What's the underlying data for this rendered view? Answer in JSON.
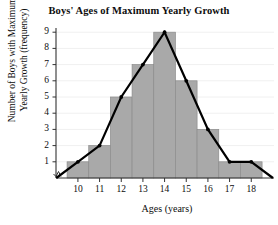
{
  "chart_data": {
    "type": "bar",
    "title": "Boys' Ages of Maximum Yearly Growth",
    "xlabel": "Ages (years)",
    "ylabel": "Number of Boys with Maximum Yearly Growth (frequency)",
    "ylabel_line1": "Number of Boys with Maximum",
    "ylabel_line2": "Yearly Growth (frequency)",
    "categories": [
      10,
      11,
      12,
      13,
      14,
      15,
      16,
      17,
      18
    ],
    "values": [
      1,
      2,
      5,
      7,
      9,
      6,
      3,
      1,
      1
    ],
    "x_tick_labels": [
      "10",
      "11",
      "12",
      "13",
      "14",
      "15",
      "16",
      "17",
      "18"
    ],
    "y_tick_labels": [
      "1",
      "2",
      "3",
      "4",
      "5",
      "6",
      "7",
      "8",
      "9"
    ],
    "ylim": [
      0,
      9
    ],
    "xlim": [
      9.5,
      18.5
    ],
    "grid": true,
    "legend": false,
    "axis_break": true,
    "overlay": {
      "type": "line",
      "name": "frequency polygon",
      "x": [
        9,
        10,
        11,
        12,
        13,
        14,
        15,
        16,
        17,
        18,
        19
      ],
      "y": [
        0,
        1,
        2,
        5,
        7,
        9,
        6,
        3,
        1,
        1,
        0
      ],
      "markers": [
        10,
        11,
        12,
        13,
        14,
        15,
        16,
        17,
        18
      ]
    },
    "colors": {
      "bar_fill": "#a9a9a9",
      "bar_edge": "#8c8c8c",
      "line": "#000000",
      "axis": "#333333",
      "grid": "#f0f0f0",
      "text": "#0d0d0d",
      "background": "#ffffff"
    }
  }
}
